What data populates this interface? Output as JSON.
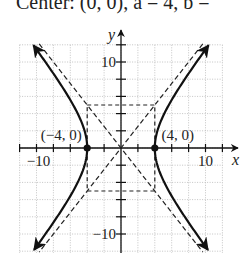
{
  "title": {
    "text": "Center: (0, 0), a = 4, b ="
  },
  "chart_data": {
    "type": "line",
    "equation": "x^2/16 - y^2/25 = 1",
    "center": [
      0,
      0
    ],
    "a": 4,
    "b": 5,
    "xlabel": "x",
    "ylabel": "y",
    "xlim": [
      -12,
      12
    ],
    "ylim": [
      -12,
      12
    ],
    "grid": true,
    "grid_step": 2,
    "x_tick_labels": [
      {
        "value": -10,
        "label": "−10"
      },
      {
        "value": 10,
        "label": "10"
      }
    ],
    "y_tick_labels": [
      {
        "value": 10,
        "label": "10"
      },
      {
        "value": -10,
        "label": "−10"
      }
    ],
    "series": [
      {
        "name": "hyperbola-right-branch",
        "style": "solid",
        "arrows": true
      },
      {
        "name": "hyperbola-left-branch",
        "style": "solid",
        "arrows": true
      },
      {
        "name": "asymptote-positive",
        "equation": "y = (5/4)x",
        "style": "dashed"
      },
      {
        "name": "asymptote-negative",
        "equation": "y = -(5/4)x",
        "style": "dashed"
      },
      {
        "name": "central-rectangle",
        "corners": [
          [
            -4,
            5
          ],
          [
            4,
            5
          ],
          [
            4,
            -5
          ],
          [
            -4,
            -5
          ]
        ],
        "style": "dashed"
      }
    ],
    "points": [
      {
        "x": -4,
        "y": 0,
        "label": "(−4, 0)"
      },
      {
        "x": 4,
        "y": 0,
        "label": "(4, 0)"
      }
    ]
  }
}
